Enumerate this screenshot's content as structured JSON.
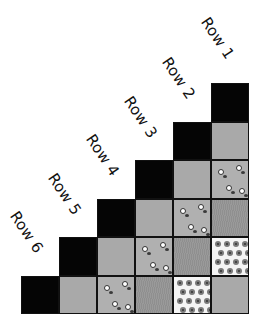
{
  "labels": {
    "row1": "Row 1",
    "row2": "Row 2",
    "row3": "Row 3",
    "row4": "Row 4",
    "row5": "Row 5",
    "row6": "Row 6"
  },
  "grid": {
    "columns": 6,
    "rows": 6,
    "cells": [
      [
        "empty",
        "empty",
        "empty",
        "empty",
        "empty",
        "black"
      ],
      [
        "empty",
        "empty",
        "empty",
        "empty",
        "black",
        "gray"
      ],
      [
        "empty",
        "empty",
        "empty",
        "black",
        "gray",
        "floral-small"
      ],
      [
        "empty",
        "empty",
        "black",
        "gray",
        "floral-small",
        "stripe"
      ],
      [
        "empty",
        "black",
        "gray",
        "floral-small",
        "stripe",
        "floral-white"
      ],
      [
        "black",
        "gray",
        "floral-small",
        "stripe",
        "floral-white",
        "gray"
      ]
    ]
  },
  "colors": {
    "black": "#050505",
    "gray": "#a9a9a9",
    "stripe": "#949494",
    "floral_small_bg": "#b0b0b0",
    "floral_white_bg": "#f4f4f4"
  }
}
